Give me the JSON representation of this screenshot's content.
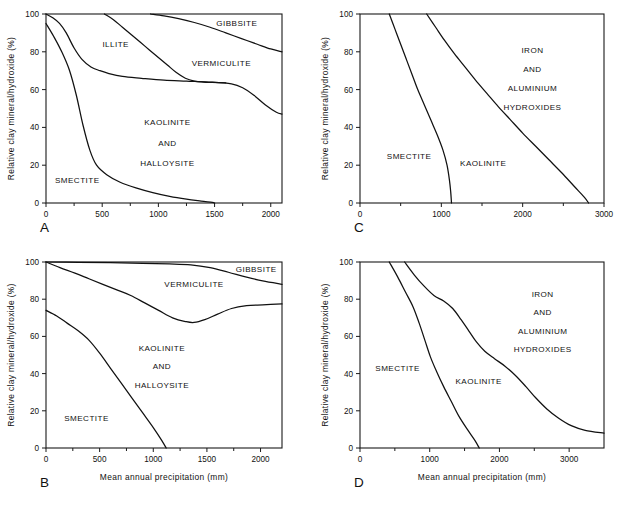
{
  "figure": {
    "axis_titles": {
      "y": "Relative clay mineral/hydroxide (%)",
      "x": "Mean annual precipitation (mm)"
    }
  },
  "chart_data": [
    {
      "id": "A",
      "type": "area",
      "title": "",
      "panel_letter": "A",
      "xlabel": "",
      "ylabel": "Relative clay mineral/hydroxide (%)",
      "xlim": [
        0,
        2100
      ],
      "ylim": [
        0,
        100
      ],
      "xticks": [
        0,
        500,
        1000,
        1500,
        2000
      ],
      "yticks": [
        0,
        20,
        40,
        60,
        80,
        100
      ],
      "grid": false,
      "legend": "none",
      "annotations": [
        {
          "text": "GIBBSITE",
          "x": 1880,
          "y": 95,
          "anchor": "right"
        },
        {
          "text": "ILLITE",
          "x": 620,
          "y": 84,
          "anchor": "middle"
        },
        {
          "text": "VERMICULITE",
          "x": 1560,
          "y": 74,
          "anchor": "middle"
        },
        {
          "text": "KAOLINITE",
          "x": 1080,
          "y": 43,
          "anchor": "middle"
        },
        {
          "text": "AND",
          "x": 1080,
          "y": 32,
          "anchor": "middle"
        },
        {
          "text": "HALLOYSITE",
          "x": 1080,
          "y": 21,
          "anchor": "middle"
        },
        {
          "text": "SMECTITE",
          "x": 80,
          "y": 12,
          "anchor": "left"
        }
      ],
      "series": [
        {
          "name": "smectite-boundary",
          "points": [
            [
              0,
              95
            ],
            [
              70,
              88
            ],
            [
              140,
              80
            ],
            [
              210,
              70
            ],
            [
              270,
              57
            ],
            [
              330,
              41
            ],
            [
              390,
              28
            ],
            [
              450,
              20
            ],
            [
              540,
              15
            ],
            [
              660,
              11
            ],
            [
              800,
              8
            ],
            [
              950,
              5.5
            ],
            [
              1100,
              3.5
            ],
            [
              1250,
              2
            ],
            [
              1380,
              1
            ],
            [
              1480,
              0.3
            ],
            [
              1500,
              0
            ]
          ]
        },
        {
          "name": "illite-lower-boundary",
          "points": [
            [
              0,
              100
            ],
            [
              60,
              98
            ],
            [
              120,
              95
            ],
            [
              180,
              90
            ],
            [
              250,
              82
            ],
            [
              320,
              76
            ],
            [
              400,
              72
            ],
            [
              480,
              70
            ],
            [
              560,
              68.5
            ],
            [
              680,
              67
            ],
            [
              850,
              66
            ],
            [
              1050,
              65
            ],
            [
              1250,
              64.5
            ],
            [
              1450,
              64
            ],
            [
              1650,
              63
            ],
            [
              1750,
              61
            ],
            [
              1850,
              57
            ],
            [
              1950,
              52
            ],
            [
              2050,
              48
            ],
            [
              2100,
              47
            ]
          ]
        },
        {
          "name": "vermiculite-left-boundary",
          "points": [
            [
              520,
              100
            ],
            [
              600,
              97
            ],
            [
              680,
              93
            ],
            [
              760,
              89
            ],
            [
              840,
              85
            ],
            [
              920,
              81
            ],
            [
              1000,
              77
            ],
            [
              1080,
              73
            ],
            [
              1160,
              69
            ],
            [
              1240,
              66
            ],
            [
              1320,
              64.5
            ],
            [
              1400,
              64
            ],
            [
              1480,
              63.8
            ],
            [
              1600,
              63.6
            ]
          ]
        },
        {
          "name": "gibbsite-boundary",
          "points": [
            [
              930,
              100
            ],
            [
              1050,
              99
            ],
            [
              1180,
              97.5
            ],
            [
              1320,
              95.5
            ],
            [
              1460,
              93
            ],
            [
              1600,
              90
            ],
            [
              1740,
              87
            ],
            [
              1880,
              84
            ],
            [
              2000,
              81.5
            ],
            [
              2100,
              80
            ]
          ]
        }
      ]
    },
    {
      "id": "C",
      "type": "area",
      "title": "",
      "panel_letter": "C",
      "xlabel": "",
      "ylabel": "Relative clay mineral/hydroxide (%)",
      "xlim": [
        0,
        3000
      ],
      "ylim": [
        0,
        100
      ],
      "xticks": [
        0,
        1000,
        2000,
        3000
      ],
      "yticks": [
        0,
        20,
        40,
        60,
        80,
        100
      ],
      "grid": false,
      "legend": "none",
      "annotations": [
        {
          "text": "IRON",
          "x": 2120,
          "y": 81,
          "anchor": "middle"
        },
        {
          "text": "AND",
          "x": 2120,
          "y": 71,
          "anchor": "middle"
        },
        {
          "text": "ALUMINIUM",
          "x": 2120,
          "y": 61,
          "anchor": "middle"
        },
        {
          "text": "HYDROXIDES",
          "x": 2120,
          "y": 51,
          "anchor": "middle"
        },
        {
          "text": "SMECTITE",
          "x": 330,
          "y": 25,
          "anchor": "left"
        },
        {
          "text": "KAOLINITE",
          "x": 1230,
          "y": 21,
          "anchor": "left"
        }
      ],
      "series": [
        {
          "name": "smectite-boundary",
          "points": [
            [
              360,
              100
            ],
            [
              430,
              92
            ],
            [
              500,
              84
            ],
            [
              570,
              76
            ],
            [
              640,
              68
            ],
            [
              710,
              60
            ],
            [
              790,
              52
            ],
            [
              870,
              44
            ],
            [
              950,
              36
            ],
            [
              1020,
              28
            ],
            [
              1070,
              20
            ],
            [
              1100,
              12
            ],
            [
              1115,
              6
            ],
            [
              1125,
              0
            ]
          ]
        },
        {
          "name": "kaolinite-boundary",
          "points": [
            [
              820,
              100
            ],
            [
              930,
              93
            ],
            [
              1040,
              86
            ],
            [
              1160,
              79
            ],
            [
              1290,
              72
            ],
            [
              1420,
              65
            ],
            [
              1560,
              58
            ],
            [
              1700,
              51
            ],
            [
              1850,
              44
            ],
            [
              2000,
              37
            ],
            [
              2160,
              30
            ],
            [
              2320,
              23
            ],
            [
              2480,
              16
            ],
            [
              2630,
              9
            ],
            [
              2760,
              3
            ],
            [
              2810,
              0
            ]
          ]
        }
      ]
    },
    {
      "id": "B",
      "type": "area",
      "title": "",
      "panel_letter": "B",
      "xlabel": "Mean annual precipitation (mm)",
      "ylabel": "Relative clay mineral/hydroxide (%)",
      "xlim": [
        0,
        2200
      ],
      "ylim": [
        0,
        100
      ],
      "xticks": [
        0,
        500,
        1000,
        1500,
        2000
      ],
      "yticks": [
        0,
        20,
        40,
        60,
        80,
        100
      ],
      "grid": false,
      "legend": "none",
      "annotations": [
        {
          "text": "GIBBSITE",
          "x": 2150,
          "y": 96.5,
          "anchor": "right"
        },
        {
          "text": "VERMICULITE",
          "x": 1380,
          "y": 88,
          "anchor": "middle"
        },
        {
          "text": "KAOLINITE",
          "x": 1080,
          "y": 54,
          "anchor": "middle"
        },
        {
          "text": "AND",
          "x": 1080,
          "y": 44,
          "anchor": "middle"
        },
        {
          "text": "HALLOYSITE",
          "x": 1080,
          "y": 34,
          "anchor": "middle"
        },
        {
          "text": "SMECTITE",
          "x": 170,
          "y": 16,
          "anchor": "left"
        }
      ],
      "series": [
        {
          "name": "smectite-boundary",
          "points": [
            [
              0,
              74
            ],
            [
              100,
              71
            ],
            [
              200,
              67
            ],
            [
              300,
              63
            ],
            [
              400,
              58
            ],
            [
              500,
              51
            ],
            [
              600,
              43
            ],
            [
              700,
              35
            ],
            [
              800,
              27
            ],
            [
              900,
              19
            ],
            [
              1000,
              11
            ],
            [
              1080,
              4
            ],
            [
              1120,
              0
            ]
          ]
        },
        {
          "name": "vermiculite-lower-boundary",
          "points": [
            [
              0,
              100
            ],
            [
              130,
              97
            ],
            [
              270,
              94
            ],
            [
              400,
              91
            ],
            [
              530,
              88
            ],
            [
              660,
              85
            ],
            [
              790,
              82
            ],
            [
              920,
              78
            ],
            [
              1050,
              74
            ],
            [
              1180,
              70
            ],
            [
              1300,
              68
            ],
            [
              1380,
              67.5
            ],
            [
              1480,
              69
            ],
            [
              1600,
              72
            ],
            [
              1730,
              75
            ],
            [
              1870,
              76.5
            ],
            [
              2020,
              77
            ],
            [
              2200,
              77.5
            ]
          ]
        },
        {
          "name": "gibbsite-boundary",
          "points": [
            [
              0,
              100
            ],
            [
              300,
              99.8
            ],
            [
              600,
              99.6
            ],
            [
              900,
              99.3
            ],
            [
              1150,
              99
            ],
            [
              1350,
              98.5
            ],
            [
              1530,
              97
            ],
            [
              1700,
              94.5
            ],
            [
              1860,
              92
            ],
            [
              2020,
              89.8
            ],
            [
              2200,
              88
            ]
          ]
        }
      ]
    },
    {
      "id": "D",
      "type": "area",
      "title": "",
      "panel_letter": "D",
      "xlabel": "Mean annual precipitation (mm)",
      "ylabel": "Relative clay mineral/hydroxide (%)",
      "xlim": [
        0,
        3500
      ],
      "ylim": [
        0,
        100
      ],
      "xticks": [
        0,
        1000,
        2000,
        3000
      ],
      "yticks": [
        0,
        20,
        40,
        60,
        80,
        100
      ],
      "grid": false,
      "legend": "none",
      "annotations": [
        {
          "text": "IRON",
          "x": 2620,
          "y": 83,
          "anchor": "middle"
        },
        {
          "text": "AND",
          "x": 2620,
          "y": 73,
          "anchor": "middle"
        },
        {
          "text": "ALUMINIUM",
          "x": 2620,
          "y": 63,
          "anchor": "middle"
        },
        {
          "text": "HYDROXIDES",
          "x": 2620,
          "y": 53,
          "anchor": "middle"
        },
        {
          "text": "SMECTITE",
          "x": 220,
          "y": 43,
          "anchor": "left"
        },
        {
          "text": "KAOLINITE",
          "x": 1370,
          "y": 36,
          "anchor": "left"
        }
      ],
      "series": [
        {
          "name": "smectite-boundary",
          "points": [
            [
              420,
              100
            ],
            [
              540,
              92
            ],
            [
              650,
              84
            ],
            [
              760,
              76
            ],
            [
              850,
              67
            ],
            [
              930,
              58
            ],
            [
              1010,
              49
            ],
            [
              1100,
              41
            ],
            [
              1200,
              33
            ],
            [
              1310,
              25
            ],
            [
              1420,
              17
            ],
            [
              1540,
              10
            ],
            [
              1650,
              4
            ],
            [
              1710,
              0
            ]
          ]
        },
        {
          "name": "kaolinite-boundary",
          "points": [
            [
              640,
              100
            ],
            [
              780,
              93
            ],
            [
              920,
              87
            ],
            [
              1060,
              82
            ],
            [
              1200,
              79
            ],
            [
              1330,
              75
            ],
            [
              1450,
              69
            ],
            [
              1560,
              63
            ],
            [
              1670,
              57
            ],
            [
              1790,
              52
            ],
            [
              1930,
              48
            ],
            [
              2080,
              44
            ],
            [
              2230,
              39
            ],
            [
              2380,
              33
            ],
            [
              2520,
              27
            ],
            [
              2680,
              21
            ],
            [
              2850,
              16
            ],
            [
              3030,
              12
            ],
            [
              3230,
              9.5
            ],
            [
              3500,
              8
            ]
          ]
        }
      ]
    }
  ]
}
